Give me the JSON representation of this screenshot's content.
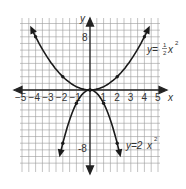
{
  "chart_data": {
    "type": "line",
    "title": "",
    "xlabel": "x",
    "ylabel": "y",
    "xlim": [
      -5,
      5
    ],
    "ylim": [
      -10,
      10
    ],
    "grid": true,
    "x_ticks": [
      "-5",
      "-4",
      "-3",
      "-2",
      "-1",
      "1",
      "2",
      "3",
      "4",
      "5"
    ],
    "y_ticks": [
      "8",
      "-8"
    ],
    "series": [
      {
        "name": "y=½x²",
        "label": "y=",
        "coef_num": "1",
        "coef_den": "2",
        "var": "x",
        "exp": "2",
        "points": [
          [
            -4,
            8
          ],
          [
            -2,
            2
          ],
          [
            0,
            0
          ],
          [
            2,
            2
          ],
          [
            4,
            8
          ]
        ]
      },
      {
        "name": "y=2x²",
        "label": "y=2",
        "var": "x",
        "exp": "2",
        "points": [
          [
            -2,
            -8
          ],
          [
            -1,
            -2
          ],
          [
            0,
            0
          ],
          [
            1,
            -2
          ],
          [
            2,
            -8
          ]
        ]
      }
    ]
  }
}
